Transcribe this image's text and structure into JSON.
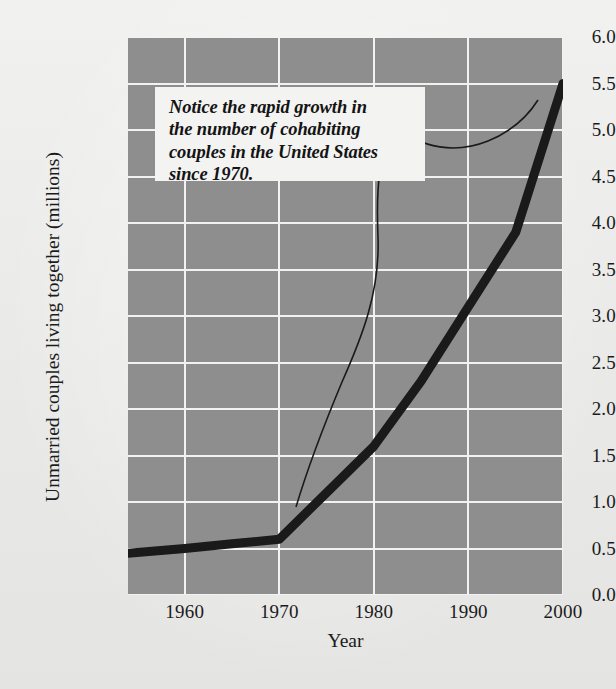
{
  "figure": {
    "background_color": "#ececeb",
    "plot_background_color": "#8e8e8e",
    "gridline_color": "#f2f2f2",
    "series_color": "#1a1a1a",
    "callout_background": "#f3f3f2"
  },
  "annotation": {
    "text": "Notice the rapid growth in\nthe number of cohabiting\ncouples in the United States\nsince 1970.",
    "points_to_year": 1970
  },
  "chart_data": {
    "type": "line",
    "title": "",
    "xlabel": "Year",
    "ylabel": "Unmarried couples living together (millions)",
    "xlim": [
      1954,
      2000
    ],
    "ylim": [
      0.0,
      6.0
    ],
    "grid": true,
    "legend": "none",
    "xticks": [
      1960,
      1970,
      1980,
      1990,
      2000
    ],
    "xtick_labels": [
      "1960",
      "1970",
      "1980",
      "1990",
      "2000"
    ],
    "yticks": [
      0.0,
      0.5,
      1.0,
      1.5,
      2.0,
      2.5,
      3.0,
      3.5,
      4.0,
      4.5,
      5.0,
      5.5,
      6.0
    ],
    "ytick_labels": [
      "0.0",
      "0.5",
      "1.0",
      "1.5",
      "2.0",
      "2.5",
      "3.0",
      "3.5",
      "4.0",
      "4.5",
      "5.0",
      "5.5",
      "6.0"
    ],
    "series": [
      {
        "name": "Unmarried couples living together",
        "x": [
          1954,
          1960,
          1965,
          1970,
          1975,
          1980,
          1985,
          1990,
          1995,
          2000
        ],
        "values": [
          0.45,
          0.5,
          0.55,
          0.6,
          1.1,
          1.6,
          2.3,
          3.1,
          3.9,
          5.5
        ]
      }
    ]
  }
}
